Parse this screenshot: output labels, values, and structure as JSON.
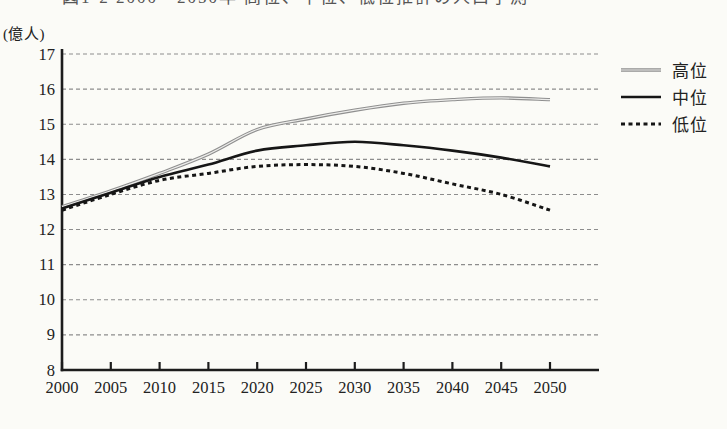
{
  "figure": {
    "title": "図1-2 2000〜2050年 高位、中位、低位推計の人口予測",
    "title_clipped": true,
    "colors": {
      "background": "#fbfbf7",
      "axis": "#1c1c1c",
      "grid": "#8d8d8d",
      "text": "#222222"
    }
  },
  "chart_data": {
    "type": "line",
    "title": "図1-2 2000〜2050年 高位、中位、低位推計の人口予測",
    "xlabel": "",
    "ylabel": "(億人)",
    "x": [
      2000,
      2005,
      2010,
      2015,
      2020,
      2025,
      2030,
      2035,
      2040,
      2045,
      2050
    ],
    "x_tick_labels": [
      "2000",
      "2005",
      "2010",
      "2015",
      "2020",
      "2025",
      "2030",
      "2035",
      "2040",
      "2045",
      "2050"
    ],
    "y_ticks": [
      8,
      9,
      10,
      11,
      12,
      13,
      14,
      15,
      16,
      17
    ],
    "ylim": [
      8,
      17
    ],
    "xlim": [
      2000,
      2050
    ],
    "grid": "horizontal-dashed",
    "legend_position": "right-outside-top",
    "series": [
      {
        "name": "高位",
        "color": "#8f8f8f",
        "core_color": "#ededeb",
        "width": 3.4,
        "dash": "",
        "values": [
          12.65,
          13.1,
          13.6,
          14.15,
          14.85,
          15.15,
          15.4,
          15.6,
          15.7,
          15.75,
          15.7
        ]
      },
      {
        "name": "中位",
        "color": "#161616",
        "core_color": "",
        "width": 2.6,
        "dash": "",
        "values": [
          12.6,
          13.05,
          13.5,
          13.85,
          14.25,
          14.4,
          14.5,
          14.4,
          14.25,
          14.05,
          13.8
        ]
      },
      {
        "name": "低位",
        "color": "#161616",
        "core_color": "",
        "width": 3,
        "dash": "4 3.5",
        "values": [
          12.55,
          13.0,
          13.4,
          13.6,
          13.8,
          13.85,
          13.8,
          13.6,
          13.3,
          13.0,
          12.55
        ]
      }
    ]
  }
}
